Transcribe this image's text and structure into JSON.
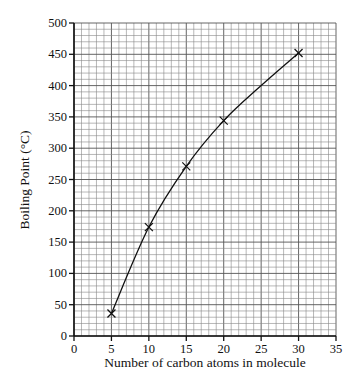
{
  "chart_data": {
    "type": "line",
    "title": "",
    "xlabel": "Number of carbon atoms in molecule",
    "ylabel": "Boiling Point (°C)",
    "xlim": [
      0,
      35
    ],
    "ylim": [
      0,
      500
    ],
    "x_ticks": [
      0,
      5,
      10,
      15,
      20,
      25,
      30,
      35
    ],
    "y_ticks": [
      0,
      50,
      100,
      150,
      200,
      250,
      300,
      350,
      400,
      450,
      500
    ],
    "grid": true,
    "grid_minor_x": 1,
    "grid_minor_y": 10,
    "marker": "x",
    "series": [
      {
        "name": "Boiling point",
        "x": [
          5,
          10,
          15,
          20,
          30
        ],
        "y": [
          36,
          174,
          271,
          344,
          452
        ]
      }
    ],
    "curve_through": {
      "x": 25,
      "y": 400
    }
  }
}
